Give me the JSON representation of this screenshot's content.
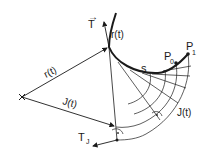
{
  "figure": {
    "labels": {
      "tangent": "T",
      "curve_point": "r(t)",
      "position_vector": "r(t)",
      "involute_vector": "J(t)",
      "involute_point": "J(t)",
      "involute_tangent": "T",
      "involute_tangent_sub": "J",
      "arc_length": "s",
      "start_point": "P",
      "start_point_sub": "0",
      "end_point": "P",
      "end_point_sub": "1"
    },
    "colors": {
      "stroke": "#1a1a1a",
      "background": "#ffffff"
    }
  }
}
